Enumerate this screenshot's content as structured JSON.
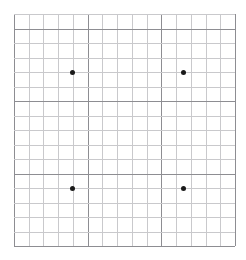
{
  "chart_data": {
    "type": "scatter",
    "title": "",
    "subtitle": "",
    "xlabel": "",
    "ylabel": "",
    "grid": true,
    "legend": null,
    "legend_position": "none",
    "background_color": "#ffffff",
    "minor_grid_color": "#c9c9cc",
    "major_grid_color": "#8d8d92",
    "point_color": "#1a1a1a",
    "point_size_px": 5,
    "xlim": [
      0,
      15
    ],
    "ylim": [
      0,
      16
    ],
    "x_minor_step": 1,
    "y_minor_step": 1,
    "x_major_step": 5,
    "y_major_step": 5,
    "x_tick_labels": [],
    "y_tick_labels": [],
    "n_columns": 15,
    "n_rows": 16,
    "x": [
      4,
      11.5,
      4,
      11.5
    ],
    "y": [
      12,
      12,
      4,
      4
    ],
    "points": [
      {
        "label": "point-top-left",
        "x": 4,
        "y": 12
      },
      {
        "label": "point-top-right",
        "x": 11.5,
        "y": 12
      },
      {
        "label": "point-bottom-left",
        "x": 4,
        "y": 4
      },
      {
        "label": "point-bottom-right",
        "x": 11.5,
        "y": 4
      }
    ],
    "annotations": []
  }
}
